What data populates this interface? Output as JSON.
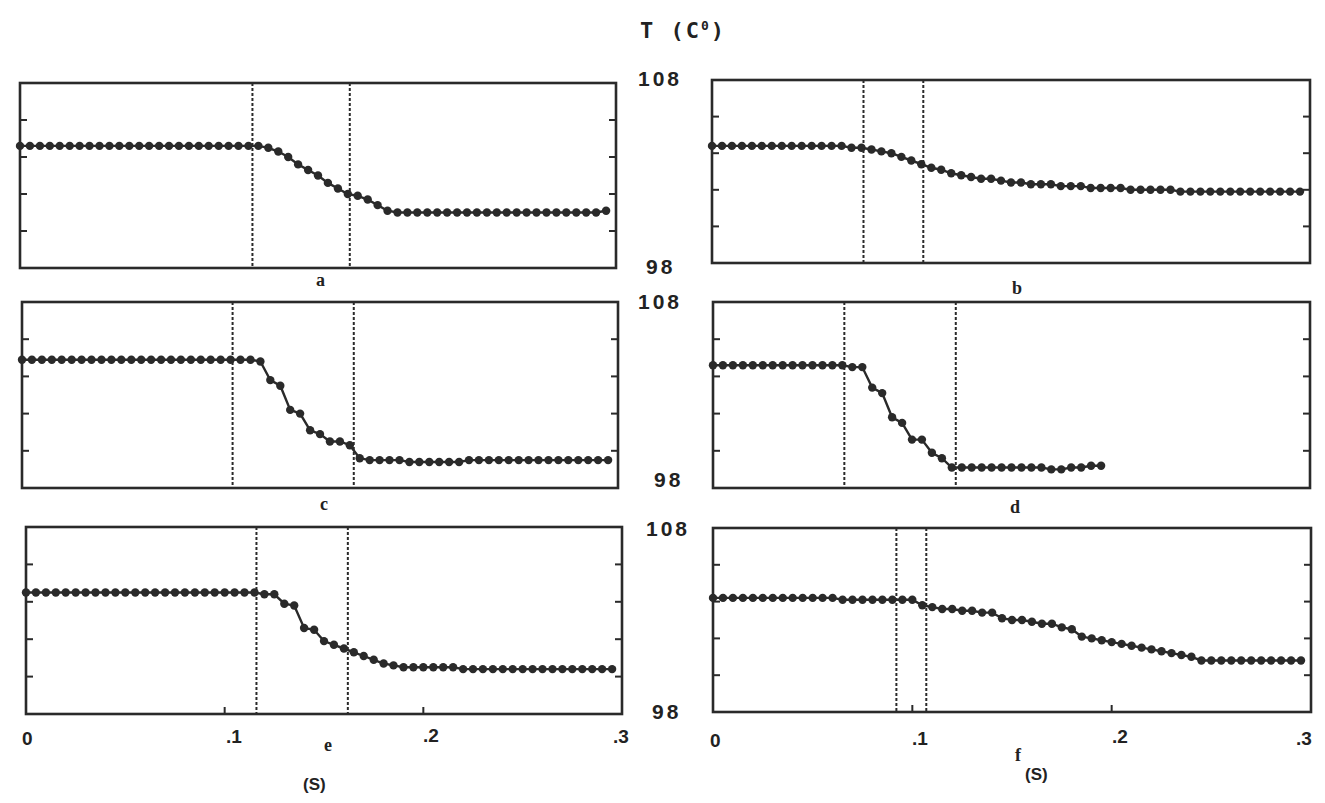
{
  "figure": {
    "title": "T (C",
    "title_sup": "0",
    "title_close": ")",
    "y_top_label": "108",
    "y_bottom_label": "98",
    "x_unit": "(S)",
    "x_ticks": [
      "0",
      ".1",
      ".2",
      ".3"
    ]
  },
  "chart_data": {
    "type": "line",
    "xlabel": "(S)",
    "ylabel": "T (C°)",
    "xlim": [
      0,
      0.3
    ],
    "ylim": [
      98,
      108
    ],
    "y_minor_ticks": [
      100,
      102,
      104,
      106
    ],
    "x_tick_labels": [
      "0",
      ".1",
      ".2",
      ".3"
    ],
    "marker": "filled circle",
    "grid": false,
    "panels": [
      {
        "id": "a",
        "label": "a",
        "vlines": [
          0.117,
          0.166
        ],
        "t_step": 0.005,
        "values": [
          104.6,
          104.6,
          104.6,
          104.6,
          104.6,
          104.6,
          104.6,
          104.6,
          104.6,
          104.6,
          104.6,
          104.6,
          104.6,
          104.6,
          104.6,
          104.6,
          104.6,
          104.6,
          104.6,
          104.6,
          104.6,
          104.6,
          104.6,
          104.6,
          104.6,
          104.5,
          104.3,
          104.0,
          103.6,
          103.3,
          103.0,
          102.6,
          102.3,
          102.0,
          101.9,
          101.7,
          101.4,
          101.1,
          101.0,
          101.0,
          101.0,
          101.0,
          101.0,
          101.0,
          101.0,
          101.0,
          101.0,
          101.0,
          101.0,
          101.0,
          101.0,
          101.0,
          101.0,
          101.0,
          101.0,
          101.0,
          101.0,
          101.0,
          101.0,
          101.1
        ]
      },
      {
        "id": "b",
        "label": "b",
        "vlines": [
          0.076,
          0.106
        ],
        "t_step": 0.005,
        "values": [
          104.4,
          104.4,
          104.4,
          104.4,
          104.4,
          104.4,
          104.4,
          104.4,
          104.4,
          104.4,
          104.4,
          104.4,
          104.4,
          104.4,
          104.3,
          104.3,
          104.2,
          104.1,
          104.0,
          103.8,
          103.6,
          103.4,
          103.2,
          103.1,
          102.9,
          102.8,
          102.7,
          102.6,
          102.6,
          102.5,
          102.4,
          102.4,
          102.3,
          102.3,
          102.3,
          102.2,
          102.2,
          102.2,
          102.1,
          102.1,
          102.1,
          102.1,
          102.0,
          102.0,
          102.0,
          102.0,
          102.0,
          101.9,
          101.9,
          101.9,
          101.9,
          101.9,
          101.9,
          101.9,
          101.9,
          101.9,
          101.9,
          101.9,
          101.9,
          101.9
        ]
      },
      {
        "id": "c",
        "label": "c",
        "vlines": [
          0.106,
          0.167
        ],
        "t_step": 0.005,
        "values": [
          104.9,
          104.9,
          104.9,
          104.9,
          104.9,
          104.9,
          104.9,
          104.9,
          104.9,
          104.9,
          104.9,
          104.9,
          104.9,
          104.9,
          104.9,
          104.9,
          104.9,
          104.9,
          104.9,
          104.9,
          104.9,
          104.9,
          104.9,
          104.9,
          104.8,
          103.8,
          103.5,
          102.2,
          102.0,
          101.1,
          100.9,
          100.5,
          100.5,
          100.3,
          99.6,
          99.5,
          99.5,
          99.5,
          99.5,
          99.4,
          99.4,
          99.4,
          99.4,
          99.4,
          99.4,
          99.5,
          99.5,
          99.5,
          99.5,
          99.5,
          99.5,
          99.5,
          99.5,
          99.5,
          99.5,
          99.5,
          99.5,
          99.5,
          99.5,
          99.5
        ]
      },
      {
        "id": "d",
        "label": "d",
        "vlines": [
          0.066,
          0.122
        ],
        "t_step": 0.005,
        "values": [
          104.6,
          104.6,
          104.6,
          104.6,
          104.6,
          104.6,
          104.6,
          104.6,
          104.6,
          104.6,
          104.6,
          104.6,
          104.6,
          104.6,
          104.5,
          104.5,
          103.4,
          103.1,
          101.8,
          101.5,
          100.6,
          100.6,
          99.9,
          99.6,
          99.1,
          99.1,
          99.1,
          99.1,
          99.1,
          99.1,
          99.1,
          99.1,
          99.1,
          99.1,
          99.0,
          99.0,
          99.1,
          99.1,
          99.2,
          99.2
        ]
      },
      {
        "id": "e",
        "label": "e",
        "vlines": [
          0.116,
          0.162
        ],
        "t_step": 0.005,
        "values": [
          104.5,
          104.5,
          104.5,
          104.5,
          104.5,
          104.5,
          104.5,
          104.5,
          104.5,
          104.5,
          104.5,
          104.5,
          104.5,
          104.5,
          104.5,
          104.5,
          104.5,
          104.5,
          104.5,
          104.5,
          104.5,
          104.5,
          104.5,
          104.5,
          104.4,
          104.4,
          103.9,
          103.8,
          102.6,
          102.5,
          101.9,
          101.7,
          101.5,
          101.3,
          101.1,
          100.9,
          100.7,
          100.6,
          100.5,
          100.5,
          100.5,
          100.5,
          100.5,
          100.5,
          100.4,
          100.4,
          100.4,
          100.4,
          100.4,
          100.4,
          100.4,
          100.4,
          100.4,
          100.4,
          100.4,
          100.4,
          100.4,
          100.4,
          100.4,
          100.4
        ]
      },
      {
        "id": "f",
        "label": "f",
        "vlines": [
          0.092,
          0.107
        ],
        "t_step": 0.005,
        "values": [
          104.2,
          104.2,
          104.2,
          104.2,
          104.2,
          104.2,
          104.2,
          104.2,
          104.2,
          104.2,
          104.2,
          104.2,
          104.2,
          104.1,
          104.1,
          104.1,
          104.1,
          104.1,
          104.1,
          104.1,
          104.1,
          103.8,
          103.7,
          103.6,
          103.6,
          103.5,
          103.5,
          103.4,
          103.4,
          103.1,
          103.0,
          103.0,
          102.9,
          102.8,
          102.8,
          102.6,
          102.5,
          102.1,
          102.0,
          101.9,
          101.8,
          101.7,
          101.6,
          101.5,
          101.4,
          101.3,
          101.2,
          101.1,
          101.0,
          100.8,
          100.8,
          100.8,
          100.8,
          100.8,
          100.8,
          100.8,
          100.8,
          100.8,
          100.8,
          100.8
        ]
      }
    ]
  }
}
